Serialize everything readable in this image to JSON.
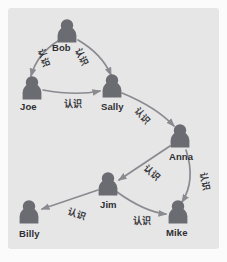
{
  "figure": {
    "name": "social-network-graph",
    "panel_bg": "#e6e6e6",
    "page_bg": "#fbfbfb",
    "node_color": "#6b6b72",
    "edge_color": "#8a8a90",
    "label_color": "#2f2f33"
  },
  "nodes": [
    {
      "id": "bob",
      "label": "Bob",
      "x": 67,
      "y": 33,
      "label_x": 52,
      "label_y": 42
    },
    {
      "id": "joe",
      "label": "Joe",
      "x": 32,
      "y": 90,
      "label_x": 20,
      "label_y": 101
    },
    {
      "id": "sally",
      "label": "Sally",
      "x": 112,
      "y": 88,
      "label_x": 101,
      "label_y": 101
    },
    {
      "id": "anna",
      "label": "Anna",
      "x": 180,
      "y": 138,
      "label_x": 169,
      "label_y": 151
    },
    {
      "id": "jim",
      "label": "Jim",
      "x": 108,
      "y": 186,
      "label_x": 100,
      "label_y": 199
    },
    {
      "id": "mike",
      "label": "Mike",
      "x": 178,
      "y": 214,
      "label_x": 166,
      "label_y": 227
    },
    {
      "id": "billy",
      "label": "Billy",
      "x": 29,
      "y": 214,
      "label_x": 19,
      "label_y": 228
    }
  ],
  "edges": [
    {
      "id": "bob-joe",
      "from": "Bob",
      "to": "Joe",
      "label": "认识",
      "label_x": 35,
      "label_y": 51,
      "label_rot": 72
    },
    {
      "id": "bob-sally",
      "from": "Bob",
      "to": "Sally",
      "label": "认识",
      "label_x": 73,
      "label_y": 50,
      "label_rot": 66
    },
    {
      "id": "joe-sally",
      "from": "Joe",
      "to": "Sally",
      "label": "认识",
      "label_x": 64,
      "label_y": 97,
      "label_rot": 0
    },
    {
      "id": "sally-anna",
      "from": "Sally",
      "to": "Anna",
      "label": "认识",
      "label_x": 134,
      "label_y": 109,
      "label_rot": 48
    },
    {
      "id": "anna-jim",
      "from": "Anna",
      "to": "Jim",
      "label": "认识",
      "label_x": 143,
      "label_y": 166,
      "label_rot": 42
    },
    {
      "id": "anna-mike",
      "from": "Anna",
      "to": "Mike",
      "label": "认识",
      "label_x": 196,
      "label_y": 175,
      "label_rot": 80
    },
    {
      "id": "jim-mike",
      "from": "Jim",
      "to": "Mike",
      "label": "认识",
      "label_x": 133,
      "label_y": 214,
      "label_rot": 0
    },
    {
      "id": "jim-billy",
      "from": "Jim",
      "to": "Billy",
      "label": "认识",
      "label_x": 68,
      "label_y": 207,
      "label_rot": 19
    }
  ]
}
